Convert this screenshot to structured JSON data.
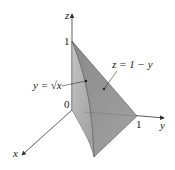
{
  "figure": {
    "axes": {
      "x_label": "x",
      "y_label": "y",
      "z_label": "z"
    },
    "ticks": {
      "origin": "0",
      "z_one": "1",
      "y_one": "1"
    },
    "annotations": {
      "curve_label": "y = √x",
      "plane_label": "z = 1 − y"
    },
    "colors": {
      "back_face": "#a9a9a9",
      "front_face": "#8e8e8e",
      "axis": "#333333",
      "edge": "#555555"
    }
  }
}
